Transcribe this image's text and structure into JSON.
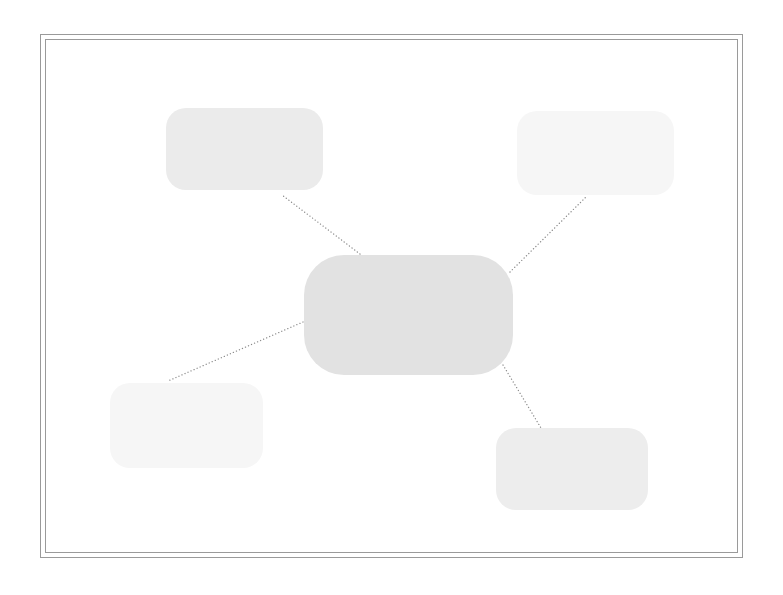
{
  "diagram": {
    "type": "hub-and-spoke concept map",
    "frame": {
      "style": "double-line border",
      "color": "#9a9a9a"
    },
    "central_node": {
      "label": "",
      "fill": "#e2e2e2"
    },
    "branch_nodes": [
      {
        "position": "top-left",
        "label": "",
        "fill": "#ebebeb"
      },
      {
        "position": "top-right",
        "label": "",
        "fill": "#f6f6f6"
      },
      {
        "position": "bottom-left",
        "label": "",
        "fill": "#f6f6f6"
      },
      {
        "position": "bottom-right",
        "label": "",
        "fill": "#ededed"
      }
    ],
    "connectors": {
      "style": "dotted",
      "color": "#8a8a8a",
      "lines": [
        {
          "from": "central_node",
          "to": "top-left",
          "x1": 360,
          "y1": 254,
          "x2": 282,
          "y2": 195
        },
        {
          "from": "central_node",
          "to": "top-right",
          "x1": 510,
          "y1": 272,
          "x2": 587,
          "y2": 196
        },
        {
          "from": "central_node",
          "to": "bottom-left",
          "x1": 303,
          "y1": 322,
          "x2": 168,
          "y2": 381
        },
        {
          "from": "central_node",
          "to": "bottom-right",
          "x1": 503,
          "y1": 365,
          "x2": 541,
          "y2": 428
        }
      ]
    }
  }
}
